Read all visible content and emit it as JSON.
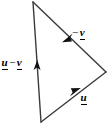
{
  "figure": {
    "type": "vector-triangle-diagram",
    "background_color": "#ffffff",
    "stroke_color": "#3a3a3a",
    "label_color": "#000000",
    "width": 112,
    "height": 128,
    "vertices": {
      "top": {
        "x": 33,
        "y": 2
      },
      "right": {
        "x": 106,
        "y": 72
      },
      "bottom": {
        "x": 41,
        "y": 122
      }
    },
    "edges": [
      {
        "name": "left-edge",
        "from": "bottom",
        "to": "top",
        "arrow_direction": "up",
        "arrow_at": {
          "x": 37,
          "y": 66
        },
        "label": "u - v"
      },
      {
        "name": "upper-right-edge",
        "from": "right",
        "to": "top",
        "arrow_direction": "up-left",
        "arrow_at": {
          "x": 67,
          "y": 38
        },
        "label": "-v"
      },
      {
        "name": "lower-right-edge",
        "from": "bottom",
        "to": "right",
        "arrow_direction": "up-right",
        "arrow_at": {
          "x": 75,
          "y": 92
        },
        "label": "u"
      }
    ],
    "labels": {
      "u_minus_v": {
        "first_symbol": "u",
        "operator": "−",
        "second_symbol": "v",
        "full_text": "u − v"
      },
      "minus_v": {
        "operator": "−",
        "symbol": "v",
        "full_text": "−v"
      },
      "u": {
        "symbol": "u",
        "full_text": "u"
      }
    }
  }
}
